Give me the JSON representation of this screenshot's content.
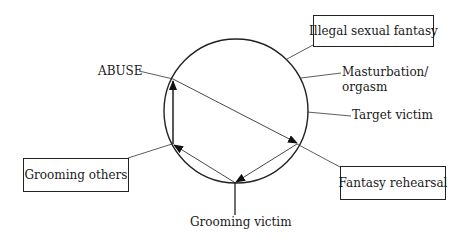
{
  "diagram": {
    "type": "cycle",
    "boxes": {
      "illegal_fantasy": "Illegal sexual fantasy",
      "grooming_others": "Grooming others",
      "fantasy_rehearsal": "Fantasy rehearsal"
    },
    "labels": {
      "abuse": "ABUSE",
      "masturbation_line1": "Masturbation/",
      "masturbation_line2": "orgasm",
      "target_victim": "Target victim",
      "grooming_victim": "Grooming victim"
    },
    "colors": {
      "line": "#222222",
      "background": "#ffffff"
    }
  }
}
